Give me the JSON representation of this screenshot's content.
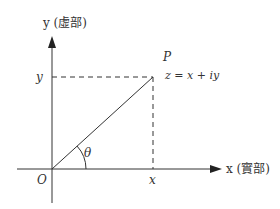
{
  "diagram": {
    "y_axis_label": "y (虛部)",
    "x_axis_label": "x (實部)",
    "y_tick_label": "y",
    "x_tick_label": "x",
    "origin_label": "O",
    "point_label": "P",
    "equation": "z = x + iy",
    "angle_label": "θ",
    "colors": {
      "line": "#333333",
      "background": "#ffffff"
    }
  }
}
